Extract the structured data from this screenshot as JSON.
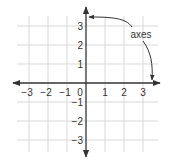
{
  "chart_data": {
    "type": "diagram",
    "title": "",
    "x_ticks": [
      -3,
      -2,
      -1,
      0,
      1,
      2,
      3
    ],
    "y_ticks": [
      3,
      2,
      1,
      -1,
      -2,
      -3
    ],
    "x_range": [
      -3.5,
      3.5
    ],
    "y_range": [
      -3.5,
      3.5
    ],
    "grid": true,
    "annotation": {
      "label": "axes",
      "points_to": [
        "y-axis",
        "x-axis"
      ]
    },
    "colors": {
      "grid": "#d9d9d9",
      "axis": "#333333",
      "text": "#333333"
    }
  }
}
